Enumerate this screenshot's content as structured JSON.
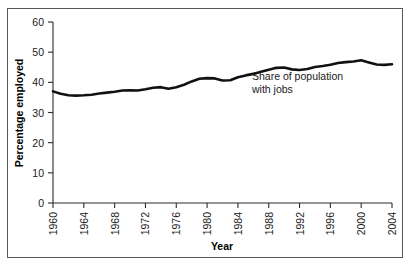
{
  "chart_data": {
    "type": "line",
    "title": "",
    "subtitle": "",
    "xlabel": "Year",
    "ylabel": "Percentage employed",
    "xlim": [
      1960,
      2004
    ],
    "ylim": [
      0,
      60
    ],
    "grid": false,
    "legend_position": "none",
    "annotations": [
      {
        "name": "series-callout",
        "line1": "Share of population",
        "line2": "with jobs",
        "x": 1986,
        "y": 30
      }
    ],
    "xticks": [
      "1960",
      "1964",
      "1968",
      "1972",
      "1976",
      "1980",
      "1984",
      "1988",
      "1992",
      "1996",
      "2000",
      "2004"
    ],
    "yticks": [
      "0",
      "10",
      "20",
      "30",
      "40",
      "50",
      "60"
    ],
    "series": [
      {
        "name": "Share of population with jobs",
        "color": "#111111",
        "x": [
          1960,
          1961,
          1962,
          1963,
          1964,
          1965,
          1966,
          1967,
          1968,
          1969,
          1970,
          1971,
          1972,
          1973,
          1974,
          1975,
          1976,
          1977,
          1978,
          1979,
          1980,
          1981,
          1982,
          1983,
          1984,
          1985,
          1986,
          1987,
          1988,
          1989,
          1990,
          1991,
          1992,
          1993,
          1994,
          1995,
          1996,
          1997,
          1998,
          1999,
          2000,
          2001,
          2002,
          2003,
          2004
        ],
        "values": [
          37.0,
          36.2,
          35.7,
          35.6,
          35.7,
          35.9,
          36.3,
          36.6,
          36.9,
          37.3,
          37.4,
          37.3,
          37.7,
          38.2,
          38.4,
          37.9,
          38.4,
          39.2,
          40.3,
          41.2,
          41.4,
          41.3,
          40.6,
          40.7,
          41.7,
          42.3,
          42.8,
          43.5,
          44.2,
          44.8,
          44.9,
          44.3,
          44.1,
          44.4,
          45.1,
          45.4,
          45.8,
          46.4,
          46.7,
          46.9,
          47.3,
          46.6,
          45.9,
          45.8,
          46.0
        ]
      }
    ]
  }
}
